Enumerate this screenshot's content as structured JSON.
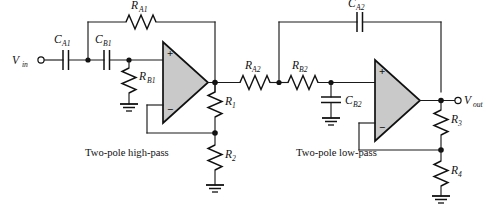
{
  "figure": {
    "type": "schematic",
    "background_color": "#ffffff",
    "line_color": "#111111",
    "opamp_fill_color": "#c9c9c9"
  },
  "terminals": {
    "input": {
      "base": "V",
      "sub": "in",
      "label": "Vin"
    },
    "output": {
      "base": "V",
      "sub": "out",
      "label": "Vout"
    }
  },
  "captions": {
    "stage1": "Two-pole high-pass",
    "stage2": "Two-pole low-pass"
  },
  "components": {
    "capacitors": [
      {
        "id": "CA1",
        "base": "C",
        "sub": "A1",
        "orientation": "horizontal"
      },
      {
        "id": "CB1",
        "base": "C",
        "sub": "B1",
        "orientation": "horizontal"
      },
      {
        "id": "CA2",
        "base": "C",
        "sub": "A2",
        "orientation": "horizontal"
      },
      {
        "id": "CB2",
        "base": "C",
        "sub": "B2",
        "orientation": "vertical"
      }
    ],
    "resistors": [
      {
        "id": "RA1",
        "base": "R",
        "sub": "A1",
        "orientation": "horizontal"
      },
      {
        "id": "RB1",
        "base": "R",
        "sub": "B1",
        "orientation": "vertical"
      },
      {
        "id": "RA2",
        "base": "R",
        "sub": "A2",
        "orientation": "horizontal"
      },
      {
        "id": "RB2",
        "base": "R",
        "sub": "B2",
        "orientation": "horizontal"
      },
      {
        "id": "R1",
        "base": "R",
        "sub": "1",
        "orientation": "vertical"
      },
      {
        "id": "R2",
        "base": "R",
        "sub": "2",
        "orientation": "vertical"
      },
      {
        "id": "R3",
        "base": "R",
        "sub": "3",
        "orientation": "vertical"
      },
      {
        "id": "R4",
        "base": "R",
        "sub": "4",
        "orientation": "vertical"
      }
    ],
    "opamps": [
      {
        "id": "U1",
        "stage": "high-pass",
        "plus": "+",
        "minus": "−"
      },
      {
        "id": "U2",
        "stage": "low-pass",
        "plus": "+",
        "minus": "−"
      }
    ],
    "grounds": [
      {
        "id": "gnd-rb1"
      },
      {
        "id": "gnd-r2"
      },
      {
        "id": "gnd-cb2"
      },
      {
        "id": "gnd-r4"
      }
    ]
  }
}
